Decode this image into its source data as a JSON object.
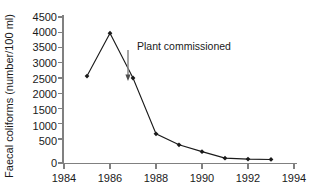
{
  "chart_data": {
    "type": "line",
    "title": "",
    "xlabel": "",
    "ylabel": "Faecal coliforms (number/100 ml)",
    "xlim": [
      1984,
      1994
    ],
    "ylim": [
      0,
      4500
    ],
    "grid": false,
    "legend": null,
    "xticks": [
      1984,
      1986,
      1988,
      1990,
      1992,
      1994
    ],
    "xticklabels": [
      "1984",
      "1986",
      "1988",
      "1990",
      "1992",
      "1994"
    ],
    "yticks": [
      0,
      500,
      1000,
      1500,
      2000,
      2500,
      3000,
      3500,
      4000,
      4500
    ],
    "yticklabels": [
      "0",
      "500",
      "1000",
      "1500",
      "2000",
      "2500",
      "3000",
      "3500",
      "4000",
      "4500"
    ],
    "x": [
      1985,
      1986,
      1987,
      1988,
      1989,
      1990,
      1991,
      1992,
      1993
    ],
    "values": [
      2680,
      4000,
      2620,
      900,
      560,
      350,
      150,
      120,
      110
    ],
    "series": [
      {
        "name": "Faecal coliforms",
        "x": [
          1985,
          1986,
          1987,
          1988,
          1989,
          1990,
          1991,
          1992,
          1993
        ],
        "values": [
          2680,
          4000,
          2620,
          900,
          560,
          350,
          150,
          120,
          110
        ],
        "marker": "filled-diamond",
        "color": "#1a1a1a"
      }
    ],
    "annotations": [
      {
        "text": "Plant commissioned",
        "arrow_x": 1987,
        "arrow_from_y": 3450,
        "arrow_to_y": 2720,
        "color": "#8a8a8a"
      }
    ]
  },
  "axes": {
    "y_axis_title": "Faecal coliforms (number/100 ml)",
    "axis_color": "#808080"
  }
}
